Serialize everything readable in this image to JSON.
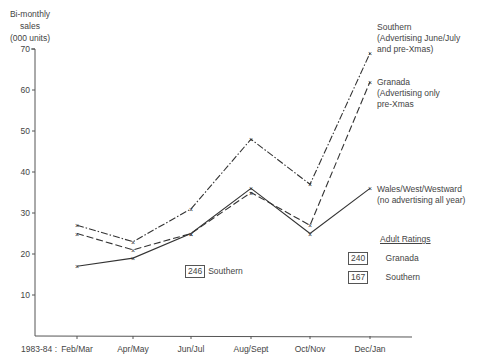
{
  "chart_data": {
    "type": "line",
    "title": "",
    "ylabel": "Bi-monthly sales (000 units)",
    "ylabel_lines": [
      "Bi-monthly",
      "sales",
      "(000 units)"
    ],
    "xlabel": "",
    "x_prefix": "1983-84 :",
    "categories": [
      "Feb/Mar",
      "Apr/May",
      "Jun/Jul",
      "Aug/Sept",
      "Oct/Nov",
      "Dec/Jan"
    ],
    "yticks": [
      10,
      20,
      30,
      40,
      50,
      60,
      70
    ],
    "ylim": [
      0,
      70
    ],
    "grid": false,
    "series": [
      {
        "name": "Southern",
        "label_lines": [
          "Southern",
          "(Advertising June/July",
          "and pre-Xmas)"
        ],
        "style": "dash-dot",
        "values": [
          27,
          23,
          31,
          48,
          37,
          69
        ]
      },
      {
        "name": "Granada",
        "label_lines": [
          "Granada",
          "(Advertising only",
          "pre-Xmas"
        ],
        "style": "dashed",
        "values": [
          25,
          21,
          25,
          35,
          27,
          62
        ]
      },
      {
        "name": "Wales/West/Westward",
        "label_lines": [
          "Wales/West/Westward",
          "(no advertising all year)"
        ],
        "style": "solid",
        "values": [
          17,
          19,
          25,
          36,
          25,
          36
        ]
      }
    ],
    "annotations": {
      "adult_ratings_title": "Adult Ratings",
      "ratings": [
        {
          "value": "240",
          "region": "Granada"
        },
        {
          "value": "167",
          "region": "Southern"
        }
      ],
      "inline_rating": {
        "value": "246",
        "region": "Southern"
      }
    }
  }
}
